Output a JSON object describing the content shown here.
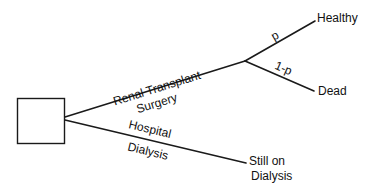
{
  "diagram": {
    "type": "decision-tree",
    "decision_node": {
      "shape": "square"
    },
    "branches": {
      "transplant": {
        "label_line1": "Renal Transplant",
        "label_line2": "Surgery"
      },
      "dialysis": {
        "label_line1": "Hospital",
        "label_line2": "Dialysis"
      }
    },
    "chance_branches": {
      "healthy_prob": "p",
      "dead_prob": "1-p"
    },
    "outcomes": {
      "healthy": "Healthy",
      "dead": "Dead",
      "still_line1": "Still on",
      "still_line2": "Dialysis"
    },
    "colors": {
      "line": "#1a1a1a",
      "text": "#111111",
      "background": "#ffffff"
    }
  }
}
